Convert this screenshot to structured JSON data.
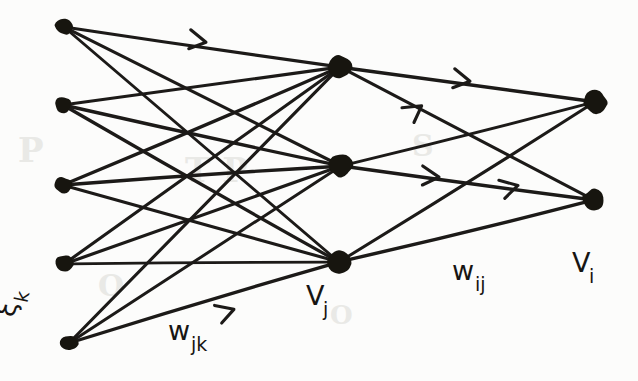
{
  "figure": {
    "style": "hand-drawn ink sketch on off-white paper",
    "ink_color": "#17150f",
    "paper_color": "#fcfcfb",
    "width": 638,
    "height": 381
  },
  "labels": {
    "input_layer": {
      "text": "ξ",
      "subscript": "k",
      "full": "ξ_k",
      "x": 14,
      "y": 318,
      "rotation": -78
    },
    "input_weights": {
      "text": "w",
      "subscript": "jk",
      "full": "w_jk",
      "x": 168,
      "y": 340
    },
    "hidden_layer": {
      "text": "V",
      "subscript": "j",
      "full": "V_j",
      "x": 306,
      "y": 305
    },
    "output_weights": {
      "text": "w",
      "subscript": "ij",
      "full": "w_ij",
      "x": 452,
      "y": 280
    },
    "output_layer": {
      "text": "V",
      "subscript": "i",
      "full": "V_i",
      "x": 572,
      "y": 272
    }
  },
  "ghost_marks": [
    {
      "text": "P",
      "x": 18,
      "y": 130,
      "size": 34
    },
    {
      "text": "T P",
      "x": 185,
      "y": 150,
      "size": 34
    },
    {
      "text": "O",
      "x": 98,
      "y": 268,
      "size": 30
    },
    {
      "text": "S",
      "x": 412,
      "y": 128,
      "size": 30
    },
    {
      "text": "O",
      "x": 330,
      "y": 300,
      "size": 26
    }
  ],
  "layers": [
    {
      "name": "input",
      "label": "ξ_k",
      "count": 5,
      "nodes": [
        {
          "id": "k1",
          "cx": 64,
          "cy": 27,
          "rx": 9,
          "ry": 8
        },
        {
          "id": "k2",
          "cx": 63,
          "cy": 105,
          "rx": 8.5,
          "ry": 8
        },
        {
          "id": "k3",
          "cx": 63,
          "cy": 185,
          "rx": 8.5,
          "ry": 8
        },
        {
          "id": "k4",
          "cx": 64,
          "cy": 264,
          "rx": 9,
          "ry": 8.5
        },
        {
          "id": "k5",
          "cx": 69,
          "cy": 343,
          "rx": 9,
          "ry": 8
        }
      ]
    },
    {
      "name": "hidden",
      "label": "V_j",
      "count": 3,
      "nodes": [
        {
          "id": "j1",
          "cx": 340,
          "cy": 67,
          "rx": 11.5,
          "ry": 11
        },
        {
          "id": "j2",
          "cx": 341,
          "cy": 166,
          "rx": 12,
          "ry": 11.5
        },
        {
          "id": "j3",
          "cx": 339,
          "cy": 262,
          "rx": 12,
          "ry": 11.5
        }
      ]
    },
    {
      "name": "output",
      "label": "V_i",
      "count": 2,
      "nodes": [
        {
          "id": "i1",
          "cx": 595,
          "cy": 102,
          "rx": 12,
          "ry": 11.5
        },
        {
          "id": "i2",
          "cx": 594,
          "cy": 200,
          "rx": 11.5,
          "ry": 11
        }
      ]
    }
  ],
  "connections": {
    "input_to_hidden": {
      "weight_label": "w_jk",
      "fully_connected": true,
      "edge_count": 15,
      "arrows": [
        {
          "x": 204,
          "y": 42,
          "angle": 9
        },
        {
          "x": 232,
          "y": 310,
          "angle": -19
        }
      ]
    },
    "hidden_to_output": {
      "weight_label": "w_ij",
      "fully_connected": true,
      "edge_count": 6,
      "arrows": [
        {
          "x": 468,
          "y": 81,
          "angle": 9
        },
        {
          "x": 420,
          "y": 107,
          "angle": -36
        },
        {
          "x": 437,
          "y": 177,
          "angle": 4
        },
        {
          "x": 516,
          "y": 186,
          "angle": -15
        }
      ]
    }
  }
}
